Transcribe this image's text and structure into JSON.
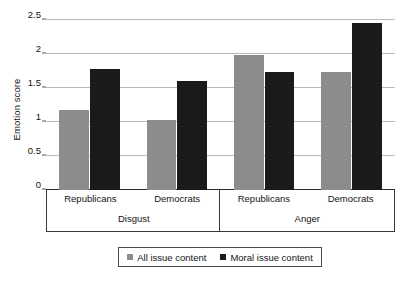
{
  "chart_data": {
    "type": "bar",
    "title": "",
    "xlabel": "",
    "ylabel": "Emotion score",
    "ylim": [
      0,
      2.5
    ],
    "yticks": [
      0,
      0.5,
      1,
      1.5,
      2,
      2.5
    ],
    "ytick_labels": [
      "0",
      "0.5",
      "1",
      "1.5",
      "2",
      "2.5"
    ],
    "grid": true,
    "legend_position": "bottom",
    "group_labels": [
      "Disgust",
      "Anger"
    ],
    "categories": [
      "Republicans",
      "Democrats",
      "Republicans",
      "Democrats"
    ],
    "series": [
      {
        "name": "All issue content",
        "color": "#8c8c8c",
        "values": [
          1.18,
          1.03,
          1.98,
          1.74
        ]
      },
      {
        "name": "Moral issue content",
        "color": "#1a1a1a",
        "values": [
          1.78,
          1.61,
          1.74,
          2.45
        ]
      }
    ],
    "groups": [
      {
        "label": "Disgust",
        "categories": [
          {
            "label": "Republicans",
            "all_issue_content": 1.18,
            "moral_issue_content": 1.78
          },
          {
            "label": "Democrats",
            "all_issue_content": 1.03,
            "moral_issue_content": 1.61
          }
        ]
      },
      {
        "label": "Anger",
        "categories": [
          {
            "label": "Republicans",
            "all_issue_content": 1.98,
            "moral_issue_content": 1.74
          },
          {
            "label": "Democrats",
            "all_issue_content": 1.74,
            "moral_issue_content": 2.45
          }
        ]
      }
    ]
  },
  "axis": {
    "y_title": "Emotion score"
  },
  "legend": {
    "entries": [
      {
        "label": "All issue content",
        "color": "#8c8c8c"
      },
      {
        "label": "Moral issue content",
        "color": "#1a1a1a"
      }
    ]
  },
  "colors": {
    "series_all_issue": "#8c8c8c",
    "series_moral_issue": "#1a1a1a",
    "gridline": "#b9b9b9",
    "axis": "#2a2a2a",
    "background": "#ffffff"
  }
}
